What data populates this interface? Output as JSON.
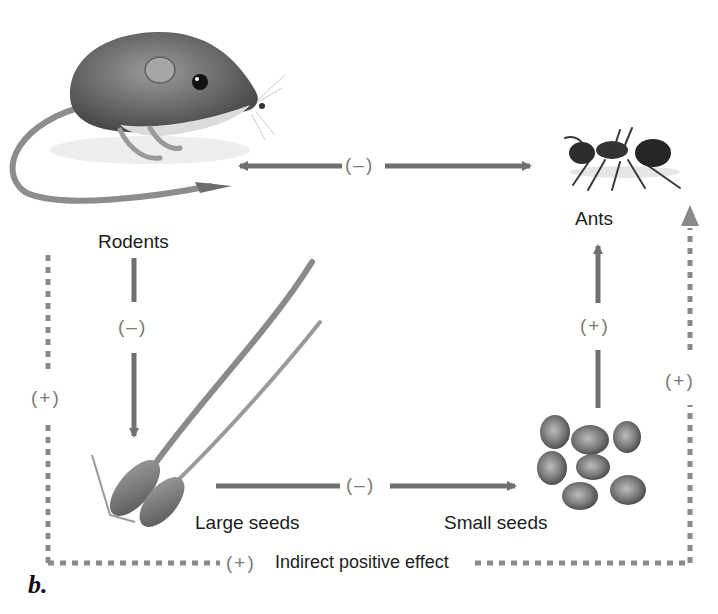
{
  "figure": {
    "panel_label": "b.",
    "colors": {
      "arrow": "#707070",
      "dashed": "#8a8a8a",
      "text": "#1c1c1c",
      "sign": "#7a7a7a"
    }
  },
  "nodes": {
    "rodents": {
      "label": "Rodents",
      "icon": "rodent-illustration"
    },
    "ants": {
      "label": "Ants",
      "icon": "ant-illustration"
    },
    "large_seeds": {
      "label": "Large seeds",
      "icon": "large-seeds-illustration"
    },
    "small_seeds": {
      "label": "Small seeds",
      "icon": "small-seeds-illustration"
    }
  },
  "edges": {
    "rodents_ants": {
      "from": "Rodents",
      "to": "Ants",
      "sign": "(–)",
      "style": "solid",
      "direction": "bidirectional"
    },
    "rodents_large_seeds": {
      "from": "Rodents",
      "to": "Large seeds",
      "sign": "(–)",
      "style": "solid"
    },
    "large_small_seeds": {
      "from": "Large seeds",
      "to": "Small seeds",
      "sign": "(–)",
      "style": "solid"
    },
    "small_seeds_ants": {
      "from": "Small seeds",
      "to": "Ants",
      "sign": "(+)",
      "style": "solid"
    },
    "indirect_left": {
      "sign": "(+)",
      "style": "dashed"
    },
    "indirect_right": {
      "sign": "(+)",
      "style": "dashed"
    },
    "indirect_bottom": {
      "sign": "(+)",
      "label": "Indirect positive effect",
      "style": "dashed"
    }
  }
}
